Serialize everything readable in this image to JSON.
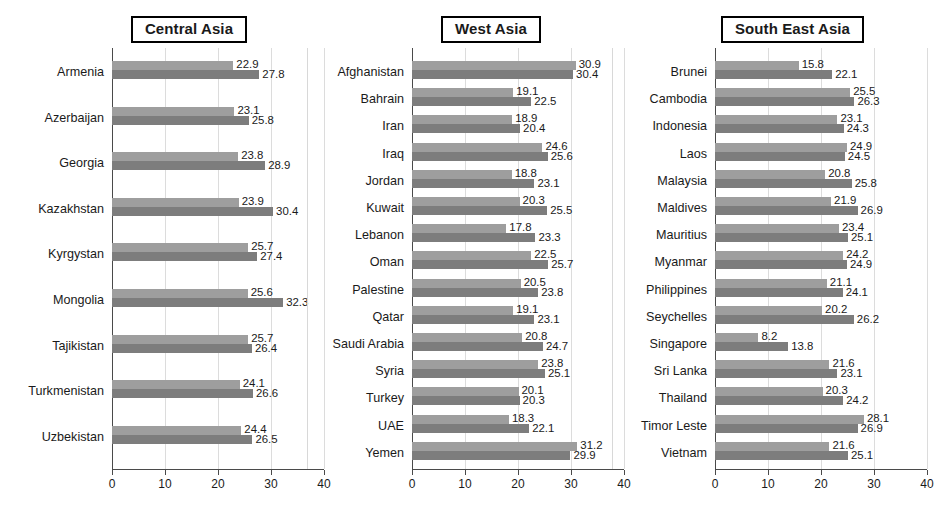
{
  "chart_data": {
    "type": "bar",
    "orientation": "horizontal",
    "title": "",
    "xlabel": "",
    "ylabel": "",
    "xlim": [
      0,
      40
    ],
    "xticks": [
      0,
      10,
      20,
      30,
      40
    ],
    "grid": true,
    "legend": "none",
    "series_names": [
      "series-1",
      "series-2"
    ],
    "series_colors": [
      "#9e9e9e",
      "#7d7d7d"
    ],
    "panels": [
      {
        "id": "central-asia",
        "title": "Central Asia",
        "categories": [
          "Armenia",
          "Azerbaijan",
          "Georgia",
          "Kazakhstan",
          "Kyrgystan",
          "Mongolia",
          "Tajikistan",
          "Turkmenistan",
          "Uzbekistan"
        ],
        "series": [
          {
            "name": "series-1",
            "values": [
              22.9,
              23.1,
              23.8,
              23.9,
              25.7,
              25.6,
              25.7,
              24.1,
              24.4
            ]
          },
          {
            "name": "series-2",
            "values": [
              27.8,
              25.8,
              28.9,
              30.4,
              27.4,
              32.3,
              26.4,
              26.6,
              26.5
            ]
          }
        ]
      },
      {
        "id": "west-asia",
        "title": "West Asia",
        "categories": [
          "Afghanistan",
          "Bahrain",
          "Iran",
          "Iraq",
          "Jordan",
          "Kuwait",
          "Lebanon",
          "Oman",
          "Palestine",
          "Qatar",
          "Saudi Arabia",
          "Syria",
          "Turkey",
          "UAE",
          "Yemen"
        ],
        "series": [
          {
            "name": "series-1",
            "values": [
              30.9,
              19.1,
              18.9,
              24.6,
              18.8,
              20.3,
              17.8,
              22.5,
              20.5,
              19.1,
              20.8,
              23.8,
              20.1,
              18.3,
              31.2
            ]
          },
          {
            "name": "series-2",
            "values": [
              30.4,
              22.5,
              20.4,
              25.6,
              23.1,
              25.5,
              23.3,
              25.7,
              23.8,
              23.1,
              24.7,
              25.1,
              20.3,
              22.1,
              29.9
            ]
          }
        ]
      },
      {
        "id": "south-east-asia",
        "title": "South East Asia",
        "categories": [
          "Brunei",
          "Cambodia",
          "Indonesia",
          "Laos",
          "Malaysia",
          "Maldives",
          "Mauritius",
          "Myanmar",
          "Philippines",
          "Seychelles",
          "Singapore",
          "Sri Lanka",
          "Thailand",
          "Timor Leste",
          "Vietnam"
        ],
        "series": [
          {
            "name": "series-1",
            "values": [
              15.8,
              25.5,
              23.1,
              24.9,
              20.8,
              21.9,
              23.4,
              24.2,
              21.1,
              20.2,
              8.2,
              21.6,
              20.3,
              28.1,
              21.6
            ]
          },
          {
            "name": "series-2",
            "values": [
              22.1,
              26.3,
              24.3,
              24.5,
              25.8,
              26.9,
              25.1,
              24.9,
              24.1,
              26.2,
              13.8,
              23.1,
              24.2,
              26.9,
              25.1
            ]
          }
        ]
      }
    ]
  }
}
